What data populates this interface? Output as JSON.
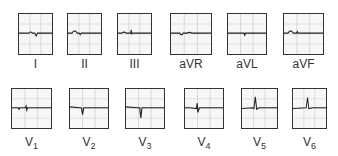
{
  "leads": [
    {
      "id": "I",
      "label": "I",
      "sub": "",
      "box": [
        18,
        13,
        35,
        42
      ],
      "trace": "M0,48 L30,48 Q35,42 40,48 L48,48 L52,55 L56,48 L100,48"
    },
    {
      "id": "II",
      "label": "II",
      "sub": "",
      "box": [
        67,
        13,
        35,
        42
      ],
      "trace": "M0,48 L12,48 Q20,36 28,48 L34,48 L37,52 L40,48 L100,48"
    },
    {
      "id": "III",
      "label": "III",
      "sub": "",
      "box": [
        117,
        13,
        35,
        42
      ],
      "trace": "M0,48 L12,48 Q18,42 24,48 L38,48 L40,40 L42,50 L44,48 L100,48"
    },
    {
      "id": "aVR",
      "label": "aVR",
      "sub": "",
      "box": [
        170,
        13,
        42,
        42
      ],
      "trace": "M0,48 L22,48 Q26,56 30,48 L40,48 Q46,44 52,48 L100,48"
    },
    {
      "id": "aVL",
      "label": "aVL",
      "sub": "",
      "box": [
        227,
        13,
        40,
        42
      ],
      "trace": "M0,48 L42,48 L44,53 L46,48 L100,48"
    },
    {
      "id": "aVF",
      "label": "aVF",
      "sub": "",
      "box": [
        283,
        13,
        41,
        42
      ],
      "trace": "M0,48 L10,48 Q17,36 24,48 L32,48 L34,44 L36,48 L100,48"
    },
    {
      "id": "V1",
      "label": "V",
      "sub": "1",
      "box": [
        11,
        88,
        41,
        41
      ],
      "trace": "M0,48 L16,48 L18,52 L20,48 L34,48 L36,44 L38,54 L40,48 L100,48"
    },
    {
      "id": "V2",
      "label": "V",
      "sub": "2",
      "box": [
        69,
        88,
        40,
        41
      ],
      "trace": "M0,46 L26,48 L30,48 L33,66 L36,48 L60,48 L100,48"
    },
    {
      "id": "V3",
      "label": "V",
      "sub": "3",
      "box": [
        125,
        88,
        40,
        41
      ],
      "trace": "M0,46 L30,48 L36,48 L39,74 L42,48 L70,48 L100,48"
    },
    {
      "id": "V4",
      "label": "V",
      "sub": "4",
      "box": [
        184,
        88,
        40,
        41
      ],
      "trace": "M0,48 L14,48 L30,50 L32,36 L34,60 L38,48 L100,48"
    },
    {
      "id": "V5",
      "label": "V",
      "sub": "5",
      "box": [
        241,
        88,
        37,
        41
      ],
      "trace": "M0,50 L30,48 L34,50 L38,20 L42,52 L48,48 L100,48"
    },
    {
      "id": "V6",
      "label": "V",
      "sub": "6",
      "box": [
        292,
        88,
        35,
        41
      ],
      "trace": "M0,50 L40,48 L44,22 L48,50 L60,48 L100,48"
    }
  ]
}
